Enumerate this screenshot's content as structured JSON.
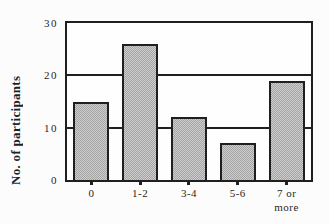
{
  "chart_data": {
    "type": "bar",
    "title": "",
    "xlabel": "",
    "ylabel": "No. of participants",
    "categories": [
      "0",
      "1-2",
      "3-4",
      "5-6",
      "7 or\nmore"
    ],
    "values": [
      15,
      26,
      12,
      7,
      19
    ],
    "ylim": [
      0,
      30
    ],
    "yticks": [
      0,
      10,
      20,
      30
    ],
    "gridlines": [
      10,
      20
    ],
    "grid": "horizontal",
    "legend": "none",
    "bar_texture": "stipple"
  },
  "colors": {
    "line": "#1f1f1f",
    "text": "#1f1f1f",
    "bar_fill_light": "#cdcdcd",
    "bar_fill_dark": "#a4a4a4",
    "plot_background": "#fefefe",
    "figure_background": "#fcfcfc"
  }
}
